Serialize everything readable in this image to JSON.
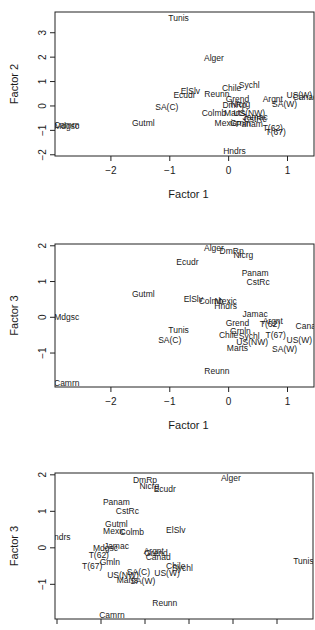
{
  "chart_data": [
    {
      "type": "scatter",
      "title": "",
      "xlabel": "Factor 1",
      "ylabel": "Factor 2",
      "xticks": [
        -2,
        -1,
        0,
        1
      ],
      "yticks": [
        -2,
        -1,
        0,
        1,
        2,
        3
      ],
      "xlim": [
        -2.95,
        1.45
      ],
      "ylim": [
        -2.05,
        3.85
      ],
      "grid": false,
      "points": [
        {
          "label": "Tunis",
          "x": -0.85,
          "y": 3.6
        },
        {
          "label": "Alger",
          "x": -0.25,
          "y": 1.95
        },
        {
          "label": "Sychl",
          "x": 0.35,
          "y": 0.85
        },
        {
          "label": "Chile",
          "x": 0.05,
          "y": 0.75
        },
        {
          "label": "ElSlv",
          "x": -0.65,
          "y": 0.6
        },
        {
          "label": "Ecudr",
          "x": -0.75,
          "y": 0.45
        },
        {
          "label": "Reunn",
          "x": -0.2,
          "y": 0.5
        },
        {
          "label": "Grend",
          "x": 0.15,
          "y": 0.3
        },
        {
          "label": "Argnt",
          "x": 0.75,
          "y": 0.3
        },
        {
          "label": "US(W)",
          "x": 1.2,
          "y": 0.45
        },
        {
          "label": "SA(W)",
          "x": 0.95,
          "y": 0.1
        },
        {
          "label": "DmRp",
          "x": 0.1,
          "y": 0.05
        },
        {
          "label": "Nicrg",
          "x": 0.2,
          "y": 0.1
        },
        {
          "label": "SA(C)",
          "x": -1.05,
          "y": -0.05
        },
        {
          "label": "Colmb",
          "x": -0.25,
          "y": -0.3
        },
        {
          "label": "Marts",
          "x": 0.1,
          "y": -0.3
        },
        {
          "label": "US(NW)",
          "x": 0.35,
          "y": -0.3
        },
        {
          "label": "Jamac",
          "x": 0.45,
          "y": -0.45
        },
        {
          "label": "CstRc",
          "x": 0.45,
          "y": -0.55
        },
        {
          "label": "Mexic",
          "x": -0.05,
          "y": -0.7
        },
        {
          "label": "Grnln",
          "x": 0.2,
          "y": -0.68
        },
        {
          "label": "Panam",
          "x": 0.35,
          "y": -0.72
        },
        {
          "label": "T(62)",
          "x": 0.75,
          "y": -0.9
        },
        {
          "label": "T(67)",
          "x": 0.8,
          "y": -1.05
        },
        {
          "label": "Gutml",
          "x": -1.45,
          "y": -0.7
        },
        {
          "label": "Camrn",
          "x": -2.75,
          "y": -0.78
        },
        {
          "label": "Mdgsc",
          "x": -2.75,
          "y": -0.82
        },
        {
          "label": "Hndrs",
          "x": 0.1,
          "y": -1.85
        },
        {
          "label": "Canad",
          "x": 1.3,
          "y": 0.35
        }
      ]
    },
    {
      "type": "scatter",
      "title": "",
      "xlabel": "Factor 1",
      "ylabel": "Factor 3",
      "xticks": [
        -2,
        -1,
        0,
        1
      ],
      "yticks": [
        -1,
        0,
        1,
        2
      ],
      "xlim": [
        -2.95,
        1.45
      ],
      "ylim": [
        -1.95,
        2.05
      ],
      "grid": false,
      "points": [
        {
          "label": "Alger",
          "x": -0.25,
          "y": 1.95
        },
        {
          "label": "DmRp",
          "x": 0.05,
          "y": 1.85
        },
        {
          "label": "Nicrg",
          "x": 0.25,
          "y": 1.75
        },
        {
          "label": "Ecudr",
          "x": -0.7,
          "y": 1.55
        },
        {
          "label": "Panam",
          "x": 0.45,
          "y": 1.25
        },
        {
          "label": "CstRc",
          "x": 0.5,
          "y": 1.0
        },
        {
          "label": "Gutml",
          "x": -1.45,
          "y": 0.65
        },
        {
          "label": "ElSlv",
          "x": -0.6,
          "y": 0.5
        },
        {
          "label": "Colmb",
          "x": -0.3,
          "y": 0.45
        },
        {
          "label": "Mexic",
          "x": -0.05,
          "y": 0.45
        },
        {
          "label": "Hndrs",
          "x": -0.05,
          "y": 0.32
        },
        {
          "label": "Mdgsc",
          "x": -2.75,
          "y": 0.0
        },
        {
          "label": "Jamac",
          "x": 0.45,
          "y": 0.08
        },
        {
          "label": "Argnt",
          "x": 0.75,
          "y": -0.1
        },
        {
          "label": "T(62)",
          "x": 0.7,
          "y": -0.18
        },
        {
          "label": "Grend",
          "x": 0.15,
          "y": -0.15
        },
        {
          "label": "Canad",
          "x": 1.35,
          "y": -0.25
        },
        {
          "label": "Tunis",
          "x": -0.85,
          "y": -0.35
        },
        {
          "label": "Grnln",
          "x": 0.2,
          "y": -0.38
        },
        {
          "label": "Chile",
          "x": 0.0,
          "y": -0.5
        },
        {
          "label": "Sychl",
          "x": 0.35,
          "y": -0.52
        },
        {
          "label": "T(67)",
          "x": 0.8,
          "y": -0.5
        },
        {
          "label": "SA(C)",
          "x": -1.0,
          "y": -0.63
        },
        {
          "label": "US(NW)",
          "x": 0.4,
          "y": -0.7
        },
        {
          "label": "US(W)",
          "x": 1.2,
          "y": -0.63
        },
        {
          "label": "SA(W)",
          "x": 0.95,
          "y": -0.88
        },
        {
          "label": "Marts",
          "x": 0.15,
          "y": -0.85
        },
        {
          "label": "Reunn",
          "x": -0.2,
          "y": -1.5
        },
        {
          "label": "Camrn",
          "x": -2.75,
          "y": -1.85
        }
      ]
    },
    {
      "type": "scatter",
      "title": "",
      "xlabel": "",
      "ylabel": "Factor 3",
      "xticks": [
        "",
        "",
        "",
        "",
        "",
        ""
      ],
      "yticks": [
        -1,
        0,
        1,
        2
      ],
      "xlim": [
        0,
        5.75
      ],
      "ylim": [
        -1.95,
        2.05
      ],
      "grid": false,
      "points": [
        {
          "label": "Alger",
          "x": 3.95,
          "y": 1.9
        },
        {
          "label": "DmRp",
          "x": 2.0,
          "y": 1.85
        },
        {
          "label": "Nicrg",
          "x": 2.1,
          "y": 1.7
        },
        {
          "label": "Ecudr",
          "x": 2.45,
          "y": 1.6
        },
        {
          "label": "Panam",
          "x": 1.35,
          "y": 1.25
        },
        {
          "label": "CstRc",
          "x": 1.6,
          "y": 1.0
        },
        {
          "label": "Gutml",
          "x": 1.35,
          "y": 0.65
        },
        {
          "label": "ElSlv",
          "x": 2.7,
          "y": 0.5
        },
        {
          "label": "Mexic",
          "x": 1.3,
          "y": 0.45
        },
        {
          "label": "Colmb",
          "x": 1.7,
          "y": 0.43
        },
        {
          "label": "Hndrs",
          "x": 0.05,
          "y": 0.3
        },
        {
          "label": "Jamac",
          "x": 1.35,
          "y": 0.05
        },
        {
          "label": "Mdgsc",
          "x": 1.1,
          "y": 0.0
        },
        {
          "label": "Argnt",
          "x": 2.2,
          "y": -0.1
        },
        {
          "label": "Grend",
          "x": 2.25,
          "y": -0.15
        },
        {
          "label": "Canad",
          "x": 2.3,
          "y": -0.25
        },
        {
          "label": "T(62)",
          "x": 0.95,
          "y": -0.2
        },
        {
          "label": "Tunis",
          "x": 5.6,
          "y": -0.35
        },
        {
          "label": "Gmln",
          "x": 1.2,
          "y": -0.4
        },
        {
          "label": "T(67)",
          "x": 0.8,
          "y": -0.5
        },
        {
          "label": "Chile",
          "x": 2.7,
          "y": -0.5
        },
        {
          "label": "Sychl",
          "x": 2.85,
          "y": -0.55
        },
        {
          "label": "SA(C)",
          "x": 1.85,
          "y": -0.65
        },
        {
          "label": "US(W)",
          "x": 2.5,
          "y": -0.68
        },
        {
          "label": "US(NW)",
          "x": 1.5,
          "y": -0.75
        },
        {
          "label": "Marts",
          "x": 1.6,
          "y": -0.88
        },
        {
          "label": "SA(W)",
          "x": 1.95,
          "y": -0.9
        },
        {
          "label": "Reunn",
          "x": 2.45,
          "y": -1.5
        },
        {
          "label": "Camrn",
          "x": 1.25,
          "y": -1.85
        }
      ]
    }
  ]
}
